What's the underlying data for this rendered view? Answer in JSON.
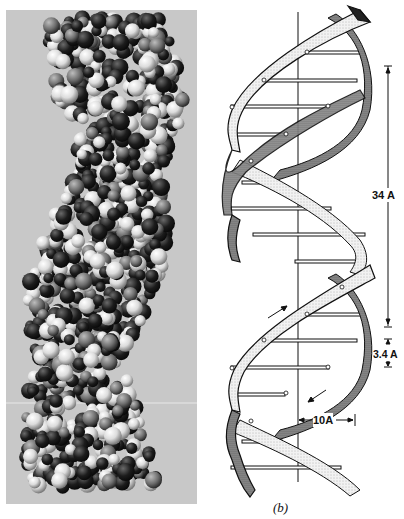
{
  "figure": {
    "left_panel": {
      "description": "Photograph of space-filling molecular model of DNA double helix",
      "background_color": "#c9c9c9",
      "atom_colors": [
        "#1a1a1a",
        "#2e2e2e",
        "#d8d8d8",
        "#f0f0f0"
      ]
    },
    "right_panel": {
      "description": "Schematic diagram of DNA double helix with two ribbon backbones, horizontal base-pair rungs and a central vertical axis",
      "caption": "(b)",
      "dimensions": {
        "pitch_label": "34 A",
        "rise_label": "3.4 A",
        "radius_label": "10A"
      },
      "strand_direction_arrows": [
        "up",
        "down"
      ],
      "ribbon_fill": "#e6e6e6",
      "line_color": "#111111"
    }
  }
}
